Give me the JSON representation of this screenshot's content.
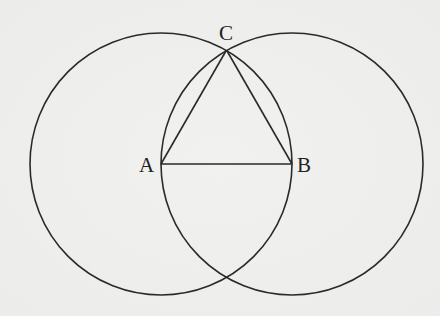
{
  "diagram": {
    "type": "geometric-construction",
    "colors": {
      "background": "#efefed",
      "stroke": "#2a2a2a",
      "text": "#222222"
    },
    "points": {
      "A": {
        "label": "A",
        "x": 161,
        "y": 164
      },
      "B": {
        "label": "B",
        "x": 292,
        "y": 164
      },
      "C": {
        "label": "C",
        "x": 226.5,
        "y": 50
      }
    },
    "circles": [
      {
        "name": "circle-centered-A",
        "cx": 161,
        "cy": 164,
        "r": 131
      },
      {
        "name": "circle-centered-B",
        "cx": 292,
        "cy": 164,
        "r": 131
      }
    ],
    "segments": [
      {
        "name": "segment-AB",
        "from": "A",
        "to": "B"
      },
      {
        "name": "segment-AC",
        "from": "A",
        "to": "C"
      },
      {
        "name": "segment-BC",
        "from": "B",
        "to": "C"
      }
    ],
    "labels": {
      "A": {
        "text": "A",
        "x": 139,
        "y": 172
      },
      "B": {
        "text": "B",
        "x": 297,
        "y": 172
      },
      "C": {
        "text": "C",
        "x": 219,
        "y": 40
      }
    }
  }
}
